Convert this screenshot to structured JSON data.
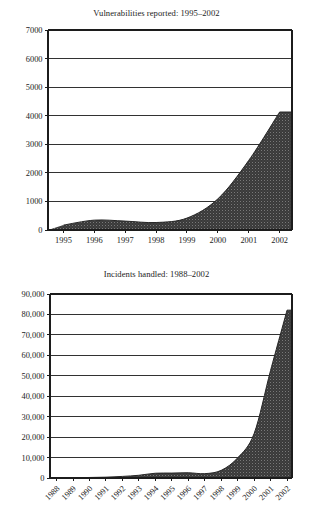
{
  "page": {
    "background": "#ffffff",
    "ink": "#1c1c1c",
    "fill_color": "#3a3a3a",
    "grid_color": "#1c1c1c"
  },
  "figures": [
    {
      "id": "vulnerabilities",
      "title": "Vulnerabilities reported: 1995–2002"
    },
    {
      "id": "incidents",
      "title": "Incidents handled: 1988–2002"
    }
  ],
  "chart_data": [
    {
      "type": "area",
      "title": "Vulnerabilities reported: 1995–2002",
      "xlabel": "",
      "ylabel": "",
      "categories": [
        "1995",
        "1996",
        "1997",
        "1998",
        "1999",
        "2000",
        "2001",
        "2002"
      ],
      "x": [
        1995,
        1996,
        1997,
        1998,
        1999,
        2000,
        2001,
        2002
      ],
      "values": [
        171,
        345,
        311,
        262,
        417,
        1090,
        2437,
        4129
      ],
      "series": [
        {
          "name": "Vulnerabilities reported",
          "values": [
            171,
            345,
            311,
            262,
            417,
            1090,
            2437,
            4129
          ]
        }
      ],
      "xlim": [
        1994.5,
        2002.4
      ],
      "ylim": [
        0,
        7000
      ],
      "ytick_values": [
        0,
        1000,
        2000,
        3000,
        4000,
        5000,
        6000,
        7000
      ],
      "ytick_labels": [
        "0",
        "1000",
        "2000",
        "3000",
        "4000",
        "5000",
        "6000",
        "7000"
      ],
      "xtick_labels": [
        "1995",
        "1996",
        "1997",
        "1998",
        "1999",
        "2000",
        "2001",
        "2002"
      ],
      "xtick_rotation": 0,
      "grid": "horizontal",
      "legend": "none",
      "fill_color": "#3a3a3a"
    },
    {
      "type": "area",
      "title": "Incidents handled: 1988–2002",
      "xlabel": "",
      "ylabel": "",
      "categories": [
        "1988",
        "1989",
        "1990",
        "1991",
        "1992",
        "1993",
        "1994",
        "1995",
        "1996",
        "1997",
        "1998",
        "1999",
        "2000",
        "2001",
        "2002"
      ],
      "x": [
        1988,
        1989,
        1990,
        1991,
        1992,
        1993,
        1994,
        1995,
        1996,
        1997,
        1998,
        1999,
        2000,
        2001,
        2002
      ],
      "values": [
        6,
        132,
        252,
        406,
        773,
        1334,
        2340,
        2412,
        2573,
        2134,
        3734,
        9859,
        21756,
        52658,
        82094
      ],
      "series": [
        {
          "name": "Incidents handled",
          "values": [
            6,
            132,
            252,
            406,
            773,
            1334,
            2340,
            2412,
            2573,
            2134,
            3734,
            9859,
            21756,
            52658,
            82094
          ]
        }
      ],
      "xlim": [
        1987.6,
        2002.3
      ],
      "ylim": [
        0,
        90000
      ],
      "ytick_values": [
        0,
        10000,
        20000,
        30000,
        40000,
        50000,
        60000,
        70000,
        80000,
        90000
      ],
      "ytick_labels": [
        "0",
        "10,000",
        "20,000",
        "30,000",
        "40,000",
        "50,000",
        "60,000",
        "70,000",
        "80,000",
        "90,000"
      ],
      "xtick_labels": [
        "1988",
        "1989",
        "1990",
        "1991",
        "1992",
        "1993",
        "1994",
        "1995",
        "1996",
        "1997",
        "1998",
        "1999",
        "2000",
        "2001",
        "2002"
      ],
      "xtick_rotation": 45,
      "grid": "horizontal",
      "legend": "none",
      "fill_color": "#3a3a3a"
    }
  ]
}
